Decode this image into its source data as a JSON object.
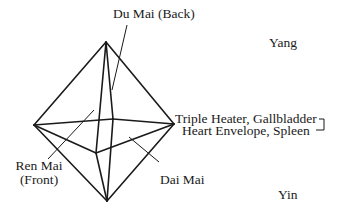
{
  "labels": {
    "du_mai": "Du Mai (Back)",
    "yang": "Yang",
    "triple_heater": "Triple Heater, Gallbladder",
    "heart_envelope": "Heart Envelope, Spleen",
    "ren_mai_line1": "Ren Mai",
    "ren_mai_line2": "(Front)",
    "dai_mai": "Dai Mai",
    "yin": "Yin"
  },
  "geometry": {
    "vertices": {
      "top": [
        106,
        42
      ],
      "left": [
        34,
        125
      ],
      "right": [
        174,
        124
      ],
      "bottom": [
        107,
        201
      ],
      "front": [
        96,
        153
      ],
      "back": [
        113,
        120
      ]
    },
    "stroke_color": "#1a1a1a"
  }
}
